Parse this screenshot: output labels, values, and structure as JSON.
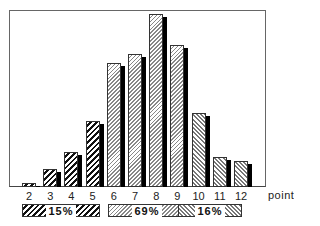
{
  "chart_data": {
    "type": "bar",
    "title": "",
    "xlabel": "points",
    "ylabel": "",
    "categories": [
      "2",
      "3",
      "4",
      "5",
      "6",
      "7",
      "8",
      "9",
      "10",
      "11",
      "12"
    ],
    "values": [
      4,
      18,
      35,
      66,
      124,
      133,
      173,
      142,
      74,
      30,
      26
    ],
    "value_units": "relative bar height (px, no y-axis shown)",
    "groups": [
      {
        "label": "15%",
        "categories": [
          "2",
          "3",
          "4",
          "5"
        ],
        "pattern": "bold-diagonal"
      },
      {
        "label": "69%",
        "categories": [
          "6",
          "7",
          "8",
          "9"
        ],
        "pattern": "fine-diagonal"
      },
      {
        "label": "16%",
        "categories": [
          "10",
          "11",
          "12"
        ],
        "pattern": "back-diagonal"
      }
    ],
    "grid": false,
    "style": "3d-shadow bars with hatch patterns"
  },
  "axis": {
    "unit_label": "points"
  },
  "legend": [
    {
      "label": "15%",
      "pattern": "p-bold"
    },
    {
      "label": "69%",
      "pattern": "p-fine"
    },
    {
      "label": "16%",
      "pattern": "p-back"
    }
  ]
}
